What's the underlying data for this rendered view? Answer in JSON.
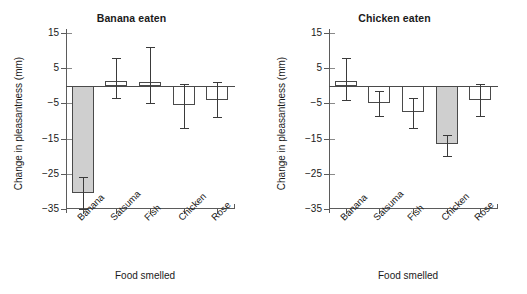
{
  "chart_data": [
    {
      "type": "bar",
      "title": "Banana eaten",
      "xlabel": "Food smelled",
      "ylabel": "Change in pleasantness (mm)",
      "categories": [
        "Banana",
        "Satsuma",
        "Fish",
        "Chicken",
        "Rose"
      ],
      "values": [
        -30.5,
        1.5,
        1.0,
        -5.5,
        -4.0
      ],
      "errors_upper": [
        -26.0,
        8.0,
        11.0,
        0.5,
        1.0
      ],
      "errors_lower": [
        -35.0,
        -3.5,
        -5.0,
        -12.0,
        -9.0
      ],
      "highlighted": [
        true,
        false,
        false,
        false,
        false
      ],
      "yticks": [
        15,
        5,
        -5,
        -15,
        -25,
        -35
      ],
      "ytick_labels": [
        "15",
        "5",
        "−5",
        "−15",
        "−25",
        "−35"
      ],
      "ylim": [
        -35,
        15
      ],
      "grid": false,
      "legend": "none"
    },
    {
      "type": "bar",
      "title": "Chicken eaten",
      "xlabel": "Food smelled",
      "ylabel": "Change in pleasantness (mm)",
      "categories": [
        "Banana",
        "Satsuma",
        "Fish",
        "Chicken",
        "Rose"
      ],
      "values": [
        1.5,
        -5.0,
        -7.5,
        -16.5,
        -4.0
      ],
      "errors_upper": [
        8.0,
        -1.5,
        -3.5,
        -14.0,
        0.5
      ],
      "errors_lower": [
        -4.0,
        -8.5,
        -12.0,
        -20.0,
        -8.5
      ],
      "highlighted": [
        false,
        false,
        false,
        true,
        false
      ],
      "yticks": [
        15,
        5,
        -5,
        -15,
        -25,
        -35
      ],
      "ytick_labels": [
        "15",
        "5",
        "−5",
        "−15",
        "−25",
        "−35"
      ],
      "ylim": [
        -35,
        15
      ],
      "grid": false,
      "legend": "none"
    }
  ],
  "panels": [
    {
      "title": "Banana eaten",
      "xlabel": "Food smelled",
      "ylabel": "Change in pleasantness (mm)",
      "ytick_labels": [
        "15",
        "5",
        "−5",
        "−15",
        "−25",
        "−35"
      ],
      "categories": [
        "Banana",
        "Satsuma",
        "Fish",
        "Chicken",
        "Rose"
      ]
    },
    {
      "title": "Chicken eaten",
      "xlabel": "Food smelled",
      "ylabel": "Change in pleasantness (mm)",
      "ytick_labels": [
        "15",
        "5",
        "−5",
        "−15",
        "−25",
        "−35"
      ],
      "categories": [
        "Banana",
        "Satsuma",
        "Fish",
        "Chicken",
        "Rose"
      ]
    }
  ],
  "style": {
    "bar_fill_highlight": "#cfcfcf",
    "bar_fill_plain": "#ffffff",
    "bar_stroke": "#4a4a4a",
    "axis_color": "#5b5b5b",
    "background": "#ffffff"
  }
}
